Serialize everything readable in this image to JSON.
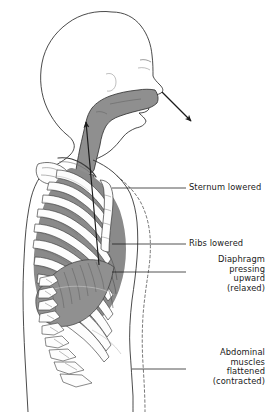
{
  "figure": {
    "background_color": "#ffffff",
    "ink_color": "#1a1a1a",
    "tissue_gray": "#8a8a8a",
    "bone_white": "#fdfdfd",
    "airway_gray": "#8f8f8f"
  },
  "labels": [
    {
      "id": "sternum",
      "name": "sternum-lowered-label",
      "lines": [
        "Sternum lowered"
      ],
      "align": "left",
      "x": 189,
      "y": 183,
      "leader": {
        "from_x": 112,
        "from_y": 188,
        "to_x": 186,
        "to_y": 188
      }
    },
    {
      "id": "ribs",
      "name": "ribs-lowered-label",
      "lines": [
        "Ribs lowered"
      ],
      "align": "left",
      "x": 189,
      "y": 239,
      "leader": {
        "from_x": 112,
        "from_y": 244,
        "to_x": 186,
        "to_y": 244
      }
    },
    {
      "id": "diaphragm",
      "name": "diaphragm-relaxed-label",
      "lines": [
        "Diaphragm",
        "pressing",
        "upward",
        "(relaxed)"
      ],
      "align": "right",
      "x": 265,
      "y": 255,
      "leader": {
        "from_x": 112,
        "from_y": 272,
        "to_x": 186,
        "to_y": 272
      }
    },
    {
      "id": "abdominal",
      "name": "abdominal-muscles-label",
      "lines": [
        "Abdominal",
        "muscles",
        "flattened",
        "(contracted)"
      ],
      "align": "right",
      "x": 265,
      "y": 348,
      "leader": {
        "from_x": 132,
        "from_y": 369,
        "to_x": 186,
        "to_y": 369
      }
    }
  ],
  "arrows": [
    {
      "id": "exhaled-air-out",
      "name": "exhaled-air-arrow",
      "description": "air leaving the nose, pointing down and to the right",
      "from_x": 162,
      "from_y": 92,
      "to_x": 193,
      "to_y": 123
    },
    {
      "id": "air-up-trachea",
      "name": "airflow-up-trachea-arrow",
      "description": "air moving up the trachea from the lungs toward the pharynx",
      "from_x": 99,
      "from_y": 265,
      "to_x": 85,
      "to_y": 117
    }
  ],
  "anatomy": [
    {
      "name": "head-profile",
      "label": "Head and face profile"
    },
    {
      "name": "nasal-cavity",
      "label": "Nasal cavity"
    },
    {
      "name": "pharynx",
      "label": "Pharynx"
    },
    {
      "name": "trachea",
      "label": "Trachea"
    },
    {
      "name": "lung-field",
      "label": "Lung field"
    },
    {
      "name": "rib-cage",
      "label": "Rib cage"
    },
    {
      "name": "sternum",
      "label": "Sternum"
    },
    {
      "name": "clavicle",
      "label": "Clavicle"
    },
    {
      "name": "scapula",
      "label": "Scapula"
    },
    {
      "name": "vertebral-column",
      "label": "Vertebral column"
    },
    {
      "name": "diaphragm",
      "label": "Diaphragm (relaxed, domed upward)"
    },
    {
      "name": "abdominal-wall",
      "label": "Abdominal wall (flattened)"
    },
    {
      "name": "inhaled-outline",
      "label": "Dashed outline: body position during inhalation"
    }
  ]
}
